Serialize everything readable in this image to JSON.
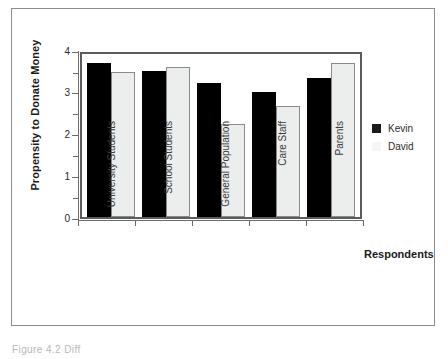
{
  "figure": {
    "caption": "Figure 4.2  Diff",
    "border_color": "#8c8c8c"
  },
  "chart_data": {
    "type": "bar",
    "title": "",
    "categories": [
      "University Students",
      "School Students",
      "General Population",
      "Care Staff",
      "Parents"
    ],
    "series": [
      {
        "name": "Kevin",
        "color": "#000000",
        "values": [
          3.78,
          3.58,
          3.28,
          3.07,
          3.42
        ]
      },
      {
        "name": "David",
        "color": "#eceded",
        "values": [
          3.55,
          3.68,
          2.28,
          2.73,
          3.78
        ]
      }
    ],
    "xlabel": "Respondents",
    "ylabel": "Propensity to Donate Money",
    "ylim": [
      0,
      4
    ],
    "ytick_labels": [
      "0",
      "1",
      "2",
      "3",
      "4"
    ],
    "ytick_values": [
      0,
      1,
      2,
      3,
      4
    ],
    "yminor_tick_values": [
      0.5,
      1.5,
      2.5,
      3.5
    ],
    "grid": false,
    "legend_position": "right"
  }
}
